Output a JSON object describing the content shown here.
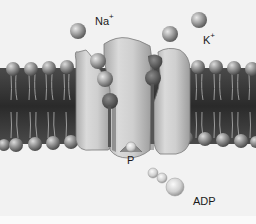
{
  "diagram": {
    "labels": {
      "sodium": {
        "text": "Na",
        "charge": "+"
      },
      "potassium": {
        "text": "K",
        "charge": "+"
      },
      "phosphate": {
        "text": "P"
      },
      "adp": {
        "text": "ADP"
      }
    },
    "colors": {
      "background": "#f2f2f2",
      "membrane_core": "#2e2e2e",
      "lipid_head": "#8a8a8a",
      "protein": "#c9c9c9",
      "binding_site": "#5a5a5a",
      "ion": "#9a9a9a"
    },
    "components": [
      "sodium-ion-extracellular",
      "potassium-ion-1",
      "potassium-ion-2",
      "lipid-bilayer",
      "pump-protein",
      "bound-sodium-ions",
      "phosphate-group",
      "adp-molecule"
    ]
  }
}
